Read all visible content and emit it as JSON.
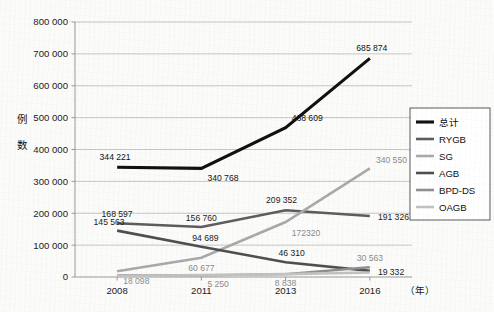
{
  "chart_data": {
    "type": "line",
    "title": "",
    "xlabel": "（年）",
    "ylabel": "例数",
    "x": [
      "2008",
      "2011",
      "2013",
      "2016"
    ],
    "categories": [
      "2008",
      "2011",
      "2013",
      "2016"
    ],
    "ylim": [
      0,
      800000
    ],
    "yticks": [
      0,
      100000,
      200000,
      300000,
      400000,
      500000,
      600000,
      700000,
      800000
    ],
    "ytick_labels": [
      "0",
      "100 000",
      "200 000",
      "300 000",
      "400 000",
      "500 000",
      "600 000",
      "700 000",
      "800 000"
    ],
    "grid": true,
    "legend_position": "right",
    "series": [
      {
        "name": "总计",
        "color": "#111111",
        "width": 3.1,
        "values": [
          344221,
          340768,
          468609,
          685874
        ],
        "labels": [
          "344 221",
          "340 768",
          "468 609",
          "685 874"
        ],
        "label_color": "#111111"
      },
      {
        "name": "RYGB",
        "color": "#5d5d5d",
        "width": 2.6,
        "values": [
          168597,
          156760,
          209352,
          191326
        ],
        "labels": [
          "168 597",
          "156 760",
          "209 352",
          "191 326"
        ],
        "label_color": "#1c1c1c"
      },
      {
        "name": "SG",
        "color": "#a9a9a9",
        "width": 2.6,
        "values": [
          18098,
          60677,
          172320,
          340550
        ],
        "labels": [
          "18 098",
          "60 677",
          "172320",
          "340 550"
        ],
        "label_color": "#8c8c8c"
      },
      {
        "name": "AGB",
        "color": "#4f4f4f",
        "width": 2.6,
        "values": [
          145563,
          94689,
          46310,
          19332
        ],
        "labels": [
          "145 563",
          "94 689",
          "46 310",
          "19 332"
        ],
        "label_color": "#1c1c1c"
      },
      {
        "name": "BPD-DS",
        "color": "#8f8f8f",
        "width": 2.3,
        "values": [
          5250,
          5250,
          8838,
          30563
        ],
        "labels": [
          "",
          "5 250",
          "8 838",
          "30 563"
        ],
        "label_color": "#8c8c8c"
      },
      {
        "name": "OAGB",
        "color": "#c2c2c2",
        "width": 2.6,
        "values": [
          3000,
          6000,
          9000,
          14000
        ],
        "labels": [
          "",
          "",
          "",
          ""
        ],
        "label_color": "#a0a0a0"
      }
    ],
    "legend_entries": [
      "总计",
      "RYGB",
      "SG",
      "AGB",
      "BPD-DS",
      "OAGB"
    ]
  },
  "axis": {
    "y_title_chars": [
      "例",
      "数"
    ],
    "x_unit": "（年）"
  }
}
